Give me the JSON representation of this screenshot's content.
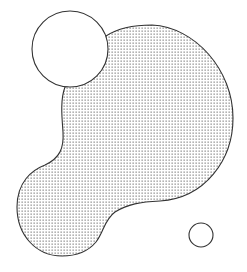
{
  "diagram": {
    "colors": {
      "background": "#ffffff",
      "stroke": "#333333",
      "dot_fill": "#8a8a8a",
      "circle_fill": "#ffffff"
    },
    "shapes": [
      {
        "id": "blob",
        "kind": "path",
        "fill": "dotted-pattern"
      },
      {
        "id": "large-circle",
        "kind": "circle",
        "cx": 70,
        "cy": 49,
        "r": 38,
        "fill": "white"
      },
      {
        "id": "small-circle",
        "kind": "circle",
        "cx": 201,
        "cy": 235,
        "r": 12,
        "fill": "white"
      }
    ]
  }
}
